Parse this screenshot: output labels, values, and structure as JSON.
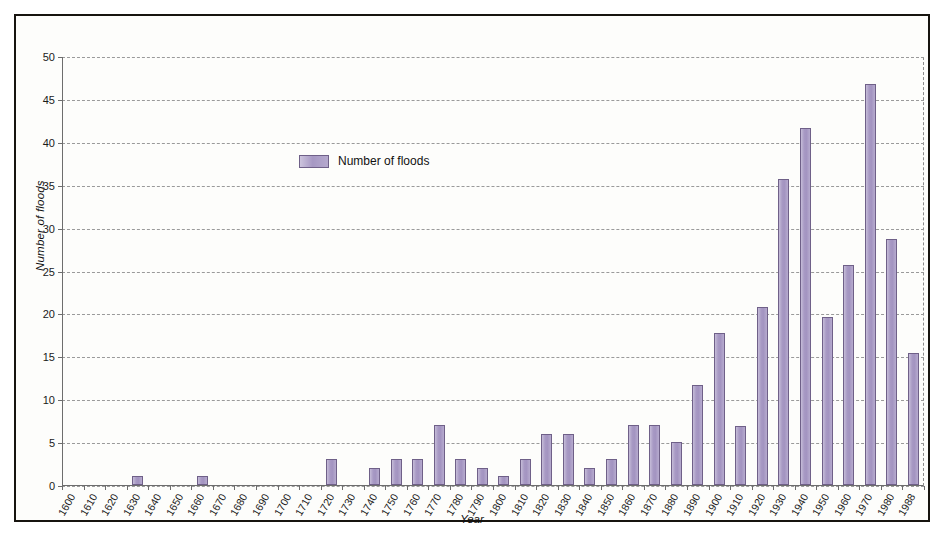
{
  "chart_data": {
    "type": "bar",
    "title": "",
    "xlabel": "Year",
    "ylabel": "Number of floods",
    "ylim": [
      0,
      50
    ],
    "ytick_step": 5,
    "yticks": [
      0,
      5,
      10,
      15,
      20,
      25,
      30,
      35,
      40,
      45,
      50
    ],
    "grid": true,
    "legend_position": "inside-upper-left",
    "legend": [
      "Number of floods"
    ],
    "series_color": "#a394c1",
    "series_edge_color": "#6f6088",
    "categories": [
      "1600",
      "1610",
      "1620",
      "1630",
      "1640",
      "1650",
      "1660",
      "1670",
      "1680",
      "1690",
      "1700",
      "1710",
      "1720",
      "1730",
      "1740",
      "1750",
      "1760",
      "1770",
      "1780",
      "1790",
      "1800",
      "1810",
      "1820",
      "1830",
      "1840",
      "1850",
      "1860",
      "1870",
      "1880",
      "1890",
      "1900",
      "1910",
      "1920",
      "1930",
      "1940",
      "1950",
      "1960",
      "1970",
      "1980",
      "1988"
    ],
    "xtick_labels": [
      "1600",
      "1610",
      "1620",
      "1630",
      "1640",
      "1650",
      "1660",
      "1670",
      "1680",
      "1690",
      "1700",
      "1710",
      "1720",
      "1730",
      "1740",
      "1750",
      "1760",
      "1770",
      "1780",
      "1790",
      "1800",
      "1810",
      "1820",
      "1830",
      "1840",
      "1850",
      "1860",
      "1870",
      "1880",
      "1890",
      "1900",
      "1910",
      "1920",
      "1930",
      "1940",
      "1950",
      "1960",
      "1970",
      "1980",
      "1988"
    ],
    "values": [
      0,
      0,
      0,
      1,
      0,
      0,
      1,
      0,
      0,
      0,
      0,
      0,
      3,
      0,
      2,
      3,
      3,
      7,
      3,
      2,
      1,
      3,
      6,
      6,
      2,
      3,
      7,
      7,
      5,
      11.7,
      17.7,
      6.9,
      20.7,
      35.7,
      41.6,
      19.6,
      25.7,
      46.7,
      28.7,
      15.4
    ],
    "series": [
      {
        "name": "Number of floods",
        "values": [
          0,
          0,
          0,
          1,
          0,
          0,
          1,
          0,
          0,
          0,
          0,
          0,
          3,
          0,
          2,
          3,
          3,
          7,
          3,
          2,
          1,
          3,
          6,
          6,
          2,
          3,
          7,
          7,
          5,
          11.7,
          17.7,
          6.9,
          20.7,
          35.7,
          41.6,
          19.6,
          25.7,
          46.7,
          28.7,
          15.4
        ]
      }
    ]
  },
  "legend": {
    "label": "Number of floods"
  },
  "axes": {
    "x_title": "Year",
    "y_title": "Number of floods"
  }
}
